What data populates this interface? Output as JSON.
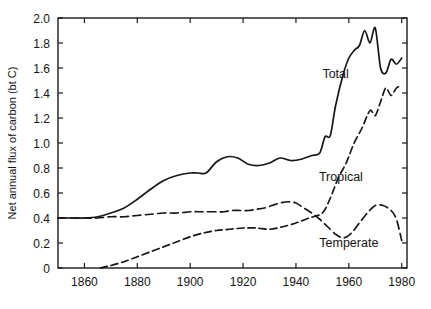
{
  "chart_data": {
    "type": "line",
    "title": "",
    "xlabel": "",
    "ylabel": "Net annual flux of carbon (bt C)",
    "xlim": [
      1850,
      1982
    ],
    "ylim": [
      0,
      2.0
    ],
    "grid": false,
    "legend_position": "inline-annotations",
    "xticks": [
      1860,
      1880,
      1900,
      1920,
      1940,
      1960,
      1980
    ],
    "xtick_labels": [
      "1860",
      "1880",
      "1900",
      "1920",
      "1940",
      "1960",
      "1980"
    ],
    "yticks": [
      0,
      0.2,
      0.4,
      0.6,
      0.8,
      1.0,
      1.2,
      1.4,
      1.6,
      1.8,
      2.0
    ],
    "ytick_labels": [
      "0",
      "0.2",
      "0.4",
      "0.6",
      "0.8",
      "1.0",
      "1.2",
      "1.4",
      "1.6",
      "1.8",
      "2.0"
    ],
    "annotations": [
      {
        "text": "Total",
        "x": 1955,
        "y": 1.52
      },
      {
        "text": "Tropical",
        "x": 1957,
        "y": 0.7
      },
      {
        "text": "Temperate",
        "x": 1960,
        "y": 0.17
      }
    ],
    "series": [
      {
        "name": "Total",
        "style": "solid",
        "x": [
          1850,
          1855,
          1860,
          1865,
          1870,
          1875,
          1880,
          1885,
          1890,
          1895,
          1900,
          1903,
          1906,
          1910,
          1914,
          1918,
          1922,
          1926,
          1930,
          1934,
          1938,
          1942,
          1946,
          1949,
          1951,
          1953,
          1955,
          1958,
          1960,
          1962,
          1964,
          1966,
          1968,
          1970,
          1972,
          1974,
          1976,
          1978,
          1980
        ],
        "y": [
          0.4,
          0.4,
          0.4,
          0.41,
          0.44,
          0.48,
          0.55,
          0.63,
          0.7,
          0.74,
          0.76,
          0.76,
          0.76,
          0.85,
          0.89,
          0.88,
          0.83,
          0.82,
          0.84,
          0.88,
          0.86,
          0.87,
          0.9,
          0.92,
          1.05,
          1.06,
          1.3,
          1.56,
          1.68,
          1.74,
          1.78,
          1.9,
          1.8,
          1.92,
          1.6,
          1.56,
          1.67,
          1.63,
          1.68
        ]
      },
      {
        "name": "Tropical",
        "style": "dashdot",
        "x": [
          1866,
          1870,
          1875,
          1880,
          1885,
          1890,
          1895,
          1900,
          1905,
          1910,
          1915,
          1920,
          1925,
          1930,
          1935,
          1940,
          1945,
          1950,
          1953,
          1956,
          1959,
          1962,
          1965,
          1968,
          1970,
          1972,
          1974,
          1976,
          1978,
          1980
        ],
        "y": [
          0.0,
          0.02,
          0.05,
          0.09,
          0.13,
          0.17,
          0.21,
          0.25,
          0.28,
          0.3,
          0.31,
          0.32,
          0.32,
          0.31,
          0.33,
          0.36,
          0.4,
          0.44,
          0.56,
          0.72,
          0.84,
          1.0,
          1.12,
          1.26,
          1.22,
          1.33,
          1.44,
          1.38,
          1.44,
          1.46
        ]
      },
      {
        "name": "Temperate",
        "style": "dashed",
        "x": [
          1850,
          1855,
          1860,
          1865,
          1870,
          1875,
          1880,
          1885,
          1890,
          1895,
          1900,
          1903,
          1906,
          1910,
          1913,
          1916,
          1919,
          1922,
          1925,
          1928,
          1931,
          1934,
          1937,
          1940,
          1943,
          1946,
          1949,
          1952,
          1955,
          1958,
          1961,
          1964,
          1967,
          1970,
          1973,
          1976,
          1978,
          1980
        ],
        "y": [
          0.4,
          0.4,
          0.4,
          0.4,
          0.41,
          0.41,
          0.42,
          0.43,
          0.44,
          0.44,
          0.45,
          0.45,
          0.45,
          0.45,
          0.45,
          0.46,
          0.46,
          0.46,
          0.47,
          0.48,
          0.5,
          0.52,
          0.53,
          0.52,
          0.48,
          0.44,
          0.39,
          0.33,
          0.27,
          0.24,
          0.28,
          0.36,
          0.44,
          0.5,
          0.5,
          0.46,
          0.39,
          0.22
        ]
      }
    ]
  }
}
